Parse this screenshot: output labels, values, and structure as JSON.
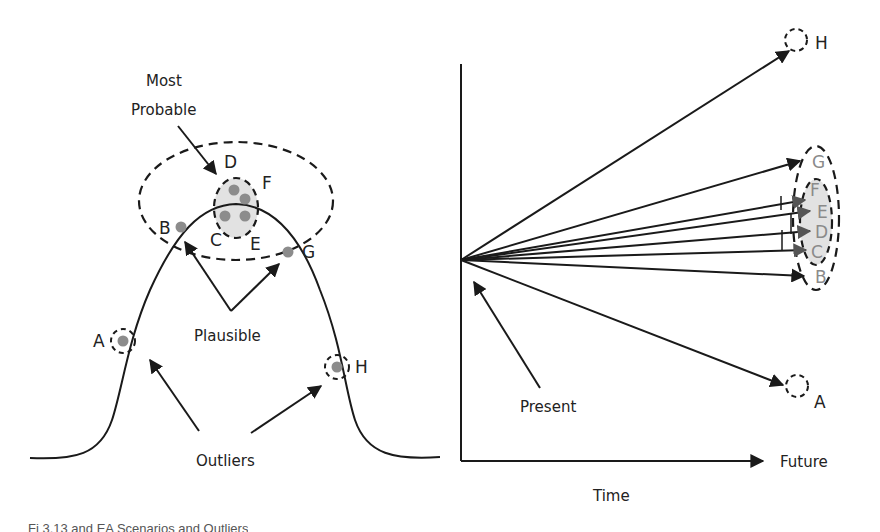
{
  "left_diagram": {
    "title": "Scenario distribution on a bell curve",
    "labels": {
      "most_probable_line1": "Most",
      "most_probable_line2": "Probable",
      "plausible": "Plausible",
      "outliers": "Outliers"
    },
    "points": [
      {
        "id": "A",
        "label": "A",
        "group": "outlier"
      },
      {
        "id": "B",
        "label": "B",
        "group": "plausible"
      },
      {
        "id": "C",
        "label": "C",
        "group": "most_probable"
      },
      {
        "id": "D",
        "label": "D",
        "group": "most_probable"
      },
      {
        "id": "E",
        "label": "E",
        "group": "most_probable"
      },
      {
        "id": "F",
        "label": "F",
        "group": "most_probable"
      },
      {
        "id": "G",
        "label": "G",
        "group": "plausible"
      },
      {
        "id": "H",
        "label": "H",
        "group": "outlier"
      }
    ]
  },
  "right_diagram": {
    "title": "Scenario trajectories over time",
    "labels": {
      "present": "Present",
      "future": "Future",
      "time": "Time"
    },
    "endpoints": [
      {
        "id": "H",
        "label": "H"
      },
      {
        "id": "G",
        "label": "G"
      },
      {
        "id": "F",
        "label": "F"
      },
      {
        "id": "E",
        "label": "E"
      },
      {
        "id": "D",
        "label": "D"
      },
      {
        "id": "C",
        "label": "C"
      },
      {
        "id": "B",
        "label": "B"
      },
      {
        "id": "A",
        "label": "A"
      }
    ]
  },
  "colors": {
    "line": "#1a1a1a",
    "dot": "#8c8c8c",
    "highlight_fill": "#e2e2e2",
    "grey_label": "#8a8a8a"
  },
  "caption": "Fi 3.13 and EA Scenarios and Outliers"
}
